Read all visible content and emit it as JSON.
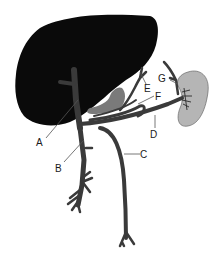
{
  "diagram": {
    "type": "anatomical illustration (hepatic portal system)",
    "colors": {
      "liver": "#0a0a0a",
      "vessels": "#3a3a3a",
      "stomach_gallbladder": "#7a7a7a",
      "spleen": "#b5b5b5",
      "leader_lines": "#555555",
      "background": "#ffffff"
    },
    "labels": {
      "A": "A",
      "B": "B",
      "C": "C",
      "D": "D",
      "E": "E",
      "F": "F",
      "G": "G"
    }
  }
}
